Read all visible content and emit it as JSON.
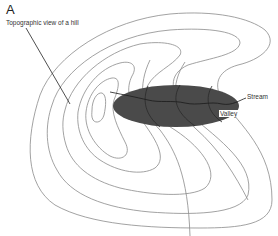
{
  "figure": {
    "panel_label": "A",
    "labels": {
      "hill": "Topographic view of a hill",
      "stream": "Stream",
      "valley": "Valley"
    },
    "colors": {
      "contour": "#8a8a8a",
      "valley_fill": "#4a4a4a",
      "stream": "#1a1a1a",
      "text": "#333333"
    },
    "contour_count": 6
  }
}
